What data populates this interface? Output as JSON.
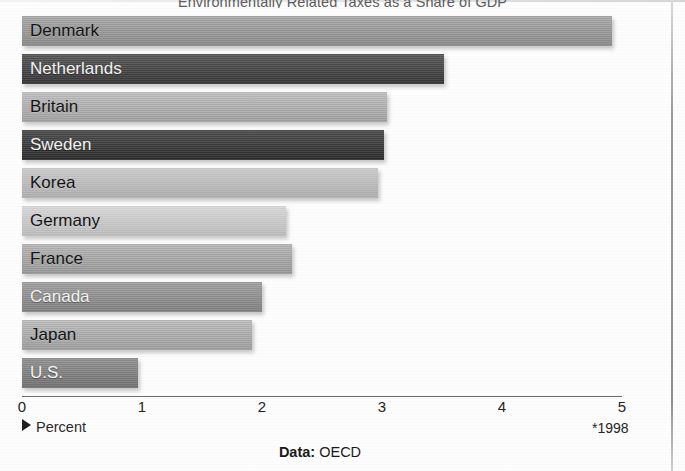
{
  "chart_data": {
    "type": "bar",
    "orientation": "horizontal",
    "title": "Environmentally Related Taxes as a Share of GDP",
    "xlabel": "Percent",
    "ylabel": "",
    "xlim": [
      0,
      5.1
    ],
    "xticks": [
      "0",
      "1",
      "2",
      "3",
      "4",
      "5"
    ],
    "grid": false,
    "legend": null,
    "categories": [
      "Denmark",
      "Netherlands",
      "Britain",
      "Sweden",
      "Korea",
      "Germany",
      "France",
      "Canada",
      "Japan",
      "U.S."
    ],
    "values": [
      4.92,
      3.52,
      3.04,
      3.02,
      2.97,
      2.2,
      2.25,
      2.0,
      1.92,
      0.97
    ],
    "bar_colors": [
      "#9a9a9a",
      "#3b3b3b",
      "#b4b4b4",
      "#2f2f2f",
      "#c3c3c3",
      "#d2d2d2",
      "#a9a9a9",
      "#8f8f8f",
      "#b0b0b0",
      "#7e7e7e"
    ],
    "label_tones": [
      "dark",
      "light",
      "dark",
      "light",
      "dark",
      "dark",
      "dark",
      "light",
      "dark",
      "light"
    ],
    "annotations": [
      "*1998"
    ],
    "source": "OECD",
    "source_prefix": "Data:"
  },
  "chart": {
    "title": "Environmentally Related Taxes as a Share of GDP",
    "axis_label": "Percent",
    "footnote": "*1998",
    "source_prefix": "Data:",
    "source_name": "OECD"
  }
}
